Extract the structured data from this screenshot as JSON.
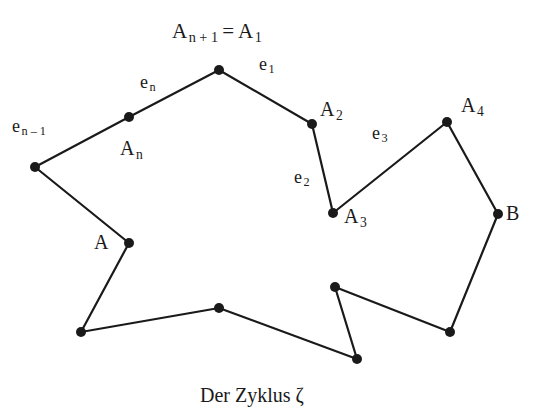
{
  "figure": {
    "caption": "Der Zyklus ζ",
    "title_label": {
      "base": "A",
      "subscript": "n + 1",
      "equals": "=",
      "base2": "A",
      "subscript2": "1"
    },
    "stroke_color": "#1a1a1a",
    "vertex_color": "#1a1a1a",
    "background_color": "#ffffff",
    "line_width": 2.2,
    "vertex_radius": 5,
    "vertices": [
      {
        "name": "A-n-plus-1",
        "x": 219,
        "y": 70,
        "label": "A",
        "sub": "n + 1"
      },
      {
        "name": "A-2",
        "x": 312,
        "y": 124,
        "label": "A",
        "sub": "2"
      },
      {
        "name": "A-3",
        "x": 333,
        "y": 213,
        "label": "A",
        "sub": "3"
      },
      {
        "name": "A-4",
        "x": 447,
        "y": 122,
        "label": "A",
        "sub": "4"
      },
      {
        "name": "B",
        "x": 498,
        "y": 214,
        "label": "B",
        "sub": ""
      },
      {
        "name": "v-right-low",
        "x": 450,
        "y": 332,
        "label": "",
        "sub": ""
      },
      {
        "name": "v-mid-low",
        "x": 335,
        "y": 287,
        "label": "",
        "sub": ""
      },
      {
        "name": "v-bottom-r",
        "x": 357,
        "y": 359,
        "label": "",
        "sub": ""
      },
      {
        "name": "v-bottom-m",
        "x": 219,
        "y": 308,
        "label": "",
        "sub": ""
      },
      {
        "name": "v-bottom-l",
        "x": 81,
        "y": 332,
        "label": "",
        "sub": ""
      },
      {
        "name": "A",
        "x": 129,
        "y": 243,
        "label": "A",
        "sub": ""
      },
      {
        "name": "v-left",
        "x": 35,
        "y": 167,
        "label": "",
        "sub": ""
      },
      {
        "name": "A-n",
        "x": 129,
        "y": 117,
        "label": "A",
        "sub": "n"
      }
    ],
    "edges": [
      {
        "name": "edge-e1",
        "from": [
          219,
          70
        ],
        "to": [
          312,
          124
        ]
      },
      {
        "name": "edge-e2",
        "from": [
          312,
          124
        ],
        "to": [
          333,
          213
        ]
      },
      {
        "name": "edge-e3",
        "from": [
          333,
          213
        ],
        "to": [
          447,
          122
        ]
      },
      {
        "name": "edge-a4-b",
        "from": [
          447,
          122
        ],
        "to": [
          498,
          214
        ]
      },
      {
        "name": "edge-b-rl",
        "from": [
          498,
          214
        ],
        "to": [
          450,
          332
        ]
      },
      {
        "name": "edge-rl-ml",
        "from": [
          450,
          332
        ],
        "to": [
          335,
          287
        ]
      },
      {
        "name": "edge-ml-br",
        "from": [
          335,
          287
        ],
        "to": [
          357,
          359
        ]
      },
      {
        "name": "edge-br-bm",
        "from": [
          357,
          359
        ],
        "to": [
          219,
          308
        ]
      },
      {
        "name": "edge-bm-bl",
        "from": [
          219,
          308
        ],
        "to": [
          81,
          332
        ]
      },
      {
        "name": "edge-bl-a",
        "from": [
          81,
          332
        ],
        "to": [
          129,
          243
        ]
      },
      {
        "name": "edge-a-vl",
        "from": [
          129,
          243
        ],
        "to": [
          35,
          167
        ]
      },
      {
        "name": "edge-en-1",
        "from": [
          35,
          167
        ],
        "to": [
          129,
          117
        ]
      },
      {
        "name": "edge-en",
        "from": [
          129,
          117
        ],
        "to": [
          219,
          70
        ]
      }
    ],
    "edge_labels": [
      {
        "name": "edge-label-e-n-minus-1",
        "base": "e",
        "sub": "n – 1",
        "x": 12,
        "y": 117
      },
      {
        "name": "edge-label-e-n",
        "base": "e",
        "sub": "n",
        "x": 140,
        "y": 73
      },
      {
        "name": "edge-label-e-1",
        "base": "e",
        "sub": "1",
        "x": 259,
        "y": 55
      },
      {
        "name": "edge-label-e-2",
        "base": "e",
        "sub": "2",
        "x": 294,
        "y": 168
      },
      {
        "name": "edge-label-e-3",
        "base": "e",
        "sub": "3",
        "x": 372,
        "y": 124
      }
    ],
    "vertex_labels": [
      {
        "name": "vertex-label-A-n",
        "base": "A",
        "sub": "n",
        "x": 120,
        "y": 138
      },
      {
        "name": "vertex-label-A-2",
        "base": "A",
        "sub": "2",
        "x": 320,
        "y": 99
      },
      {
        "name": "vertex-label-A-3",
        "base": "A",
        "sub": "3",
        "x": 344,
        "y": 206
      },
      {
        "name": "vertex-label-A-4",
        "base": "A",
        "sub": "4",
        "x": 461,
        "y": 95
      },
      {
        "name": "vertex-label-B",
        "base": "B",
        "sub": "",
        "x": 506,
        "y": 203
      },
      {
        "name": "vertex-label-A",
        "base": "A",
        "sub": "",
        "x": 94,
        "y": 232
      }
    ],
    "title_pos": {
      "x": 172,
      "y": 21
    },
    "caption_pos": {
      "x": 200,
      "y": 385
    }
  }
}
